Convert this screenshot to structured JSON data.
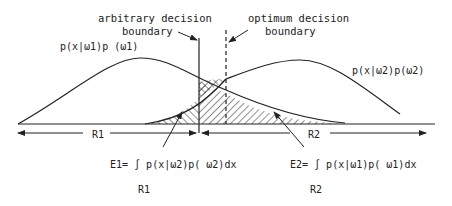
{
  "labels": {
    "arbitrary_line1": "arbitrary decision",
    "arbitrary_line2": "boundary",
    "optimum_line1": "optimum decision",
    "optimum_line2": "boundary",
    "curve1": "p(x|ω1)p (ω1)",
    "curve2": "p(x|ω2)p(ω2)",
    "region1": "R1",
    "region2": "R2",
    "error1": "E1= ∫ p(x|ω2)p( ω2)dx",
    "error1_sub": "R1",
    "error2": "E2= ∫ p(x|ω1)p( ω1)dx",
    "error2_sub": "R2"
  },
  "colors": {
    "ink": "#222222",
    "background": "#ffffff"
  }
}
